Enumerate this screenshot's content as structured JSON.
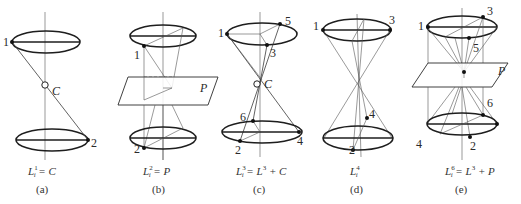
{
  "figure": {
    "panels": [
      {
        "id": "a",
        "subcaption": "(a)",
        "formula": {
          "lhs_base": "L",
          "lhs_sup": "1",
          "lhs_sub": "i",
          "rhs": "= C"
        },
        "point_labels": [
          "1",
          "2"
        ],
        "center_label": "C"
      },
      {
        "id": "b",
        "subcaption": "(b)",
        "formula": {
          "lhs_base": "L",
          "lhs_sup": "2",
          "lhs_sub": "i",
          "rhs": "= P"
        },
        "point_labels": [
          "1",
          "2"
        ],
        "plane_label": "P"
      },
      {
        "id": "c",
        "subcaption": "(c)",
        "formula": {
          "lhs_base": "L",
          "lhs_sup": "3",
          "lhs_sub": "i",
          "rhs_base": "= L",
          "rhs_sup": "3",
          "rhs_tail": "+ C"
        },
        "point_labels": [
          "1",
          "5",
          "3",
          "6",
          "2",
          "4"
        ],
        "center_label": "C"
      },
      {
        "id": "d",
        "subcaption": "(d)",
        "formula": {
          "lhs_base": "L",
          "lhs_sup": "4",
          "lhs_sub": "i"
        },
        "point_labels": [
          "1",
          "3",
          "4",
          "2"
        ]
      },
      {
        "id": "e",
        "subcaption": "(e)",
        "formula": {
          "lhs_base": "L",
          "lhs_sup": "6",
          "lhs_sub": "i",
          "rhs_base": "= L",
          "rhs_sup": "3",
          "rhs_tail": "+ P"
        },
        "point_labels": [
          "1",
          "3",
          "5",
          "6",
          "4",
          "2"
        ],
        "plane_label": "P"
      }
    ]
  }
}
